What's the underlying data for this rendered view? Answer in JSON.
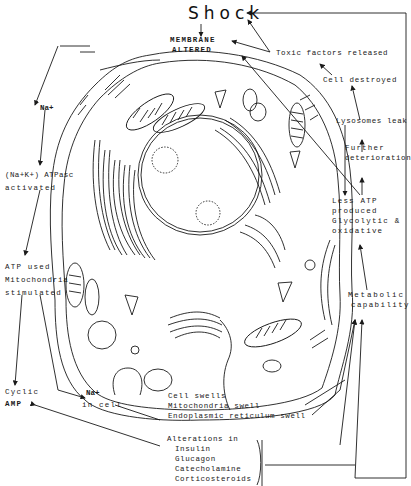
{
  "title": "Shock",
  "labels": {
    "membrane": "MEMBRANE",
    "altered": "ALTERED",
    "toxic": "Toxic factors released",
    "cell_destroyed": "Cell destroyed",
    "lysosomes": "Lysosomes leak",
    "further1": "Further",
    "further2": "deterioration",
    "less_atp1": "Less ATP",
    "less_atp2": "produced",
    "less_atp3": "Glycolytic &",
    "less_atp4": "oxidative",
    "metabolic1": "Metabolic",
    "metabolic2": "capability",
    "na_top": "Na+",
    "atpase1": "(Na+K+) ATPasc",
    "atpase2": "activated",
    "atp_used1": "ATP used",
    "atp_used2": "Mitochondria",
    "atp_used3": "stimulated",
    "cyclic1": "Cyclic",
    "cyclic2": "AMP",
    "na_cell1": "Na+",
    "na_cell2": "in cell",
    "swell1": "Cell swells",
    "swell2": "Mitochondria swell",
    "swell3": "Endoplasmic reticulum swell",
    "alter_title": "Alterations in",
    "alter_items": [
      "Insulin",
      "Glucagon",
      "Catecholamine",
      "Corticosteroids"
    ]
  },
  "colors": {
    "ink": "#1a1a1a",
    "background": "#ffffff"
  }
}
